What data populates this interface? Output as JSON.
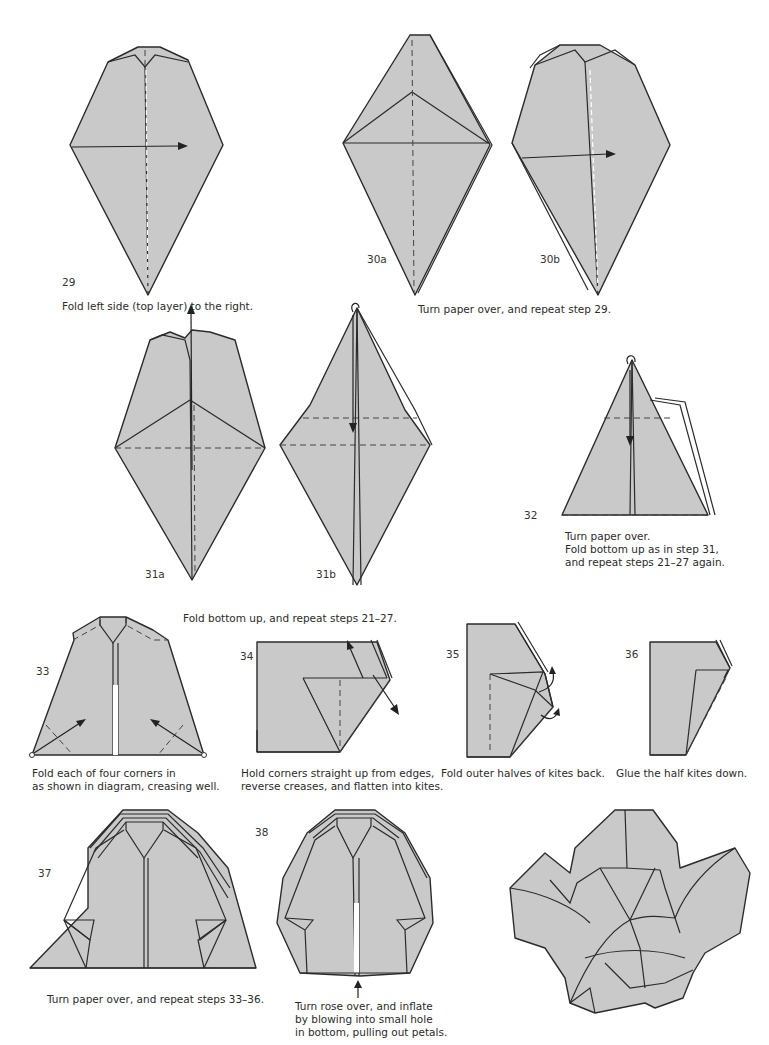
{
  "page": {
    "background": "#ffffff",
    "paper_color": "#c9c9c9",
    "line_color": "#2b2b2b"
  },
  "steps": [
    {
      "number": "29",
      "caption": "Fold left side (top layer) to the right."
    },
    {
      "labels": [
        "30a",
        "30b"
      ],
      "caption": "Turn paper over, and repeat step 29."
    },
    {
      "labels": [
        "31a",
        "31b"
      ],
      "caption": "Fold bottom up, and repeat steps 21–27."
    },
    {
      "number": "32",
      "caption_lines": [
        "Turn paper over.",
        "Fold bottom up as in step 31,",
        "and repeat steps 21–27 again."
      ]
    },
    {
      "number": "33",
      "caption_lines": [
        "Fold each of four corners in",
        "as shown in diagram, creasing well."
      ]
    },
    {
      "number": "34",
      "caption_lines": [
        "Hold corners straight up from edges,",
        "reverse creases, and flatten into kites."
      ]
    },
    {
      "number": "35",
      "caption": "Fold outer halves of kites back."
    },
    {
      "number": "36",
      "caption": "Glue the half kites down."
    },
    {
      "number": "37",
      "caption": "Turn paper over, and repeat steps 33–36."
    },
    {
      "number": "38",
      "caption_lines": [
        "Turn rose over, and inflate",
        "by blowing into small hole",
        "in bottom, pulling out petals."
      ]
    }
  ],
  "final_model": {
    "icon": "origami-rose-finished"
  }
}
